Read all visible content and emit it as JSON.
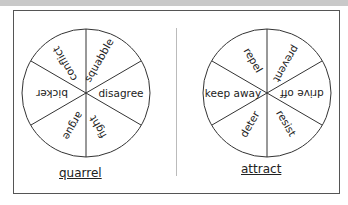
{
  "wheels": [
    {
      "label": "quarrel",
      "segments": [
        "squabble",
        "disagree",
        "fight",
        "argue",
        "bicker",
        "conflict"
      ]
    },
    {
      "label": "attract",
      "segments": [
        "prevent",
        "drive off",
        "resist",
        "deter",
        "keep away",
        "repel"
      ]
    }
  ],
  "colors": {
    "line": "#333333",
    "text": "#222222",
    "band": "#c9c9c9"
  }
}
